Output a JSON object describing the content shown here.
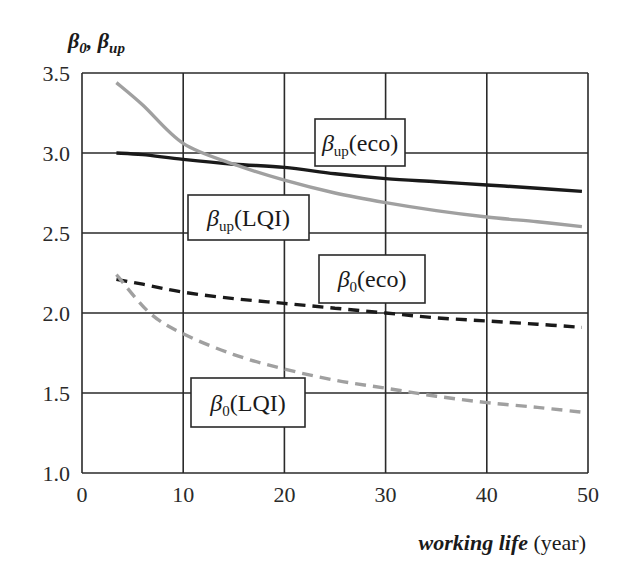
{
  "chart_data": {
    "type": "line",
    "title": "",
    "xlabel": "working life (year)",
    "xlabel_italic_part": "working life",
    "xlabel_unit": "(year)",
    "ylabel": "β0, βup",
    "xlim": [
      0,
      50
    ],
    "ylim": [
      1.0,
      3.5
    ],
    "x_ticks": [
      "0",
      "10",
      "20",
      "30",
      "40",
      "50"
    ],
    "y_ticks": [
      "1.0",
      "1.5",
      "2.0",
      "2.5",
      "3.0",
      "3.5"
    ],
    "grid": true,
    "legend": "inline labels in boxes",
    "series": [
      {
        "name": "βup(eco)",
        "label_main": "β",
        "label_sub": "up",
        "label_tail": "(eco)",
        "style": "solid",
        "color": "#1a1a1a",
        "x": [
          3.4,
          6,
          10,
          15,
          20,
          25,
          30,
          35,
          40,
          45,
          49.4
        ],
        "y": [
          3.0,
          2.99,
          2.96,
          2.93,
          2.91,
          2.87,
          2.84,
          2.82,
          2.8,
          2.78,
          2.76
        ]
      },
      {
        "name": "βup(LQI)",
        "label_main": "β",
        "label_sub": "up",
        "label_tail": "(LQI)",
        "style": "solid",
        "color": "#a0a0a0",
        "x": [
          3.4,
          6,
          10,
          15,
          20,
          25,
          30,
          35,
          40,
          45,
          49.4
        ],
        "y": [
          3.44,
          3.3,
          3.06,
          2.93,
          2.83,
          2.75,
          2.69,
          2.64,
          2.6,
          2.57,
          2.54
        ]
      },
      {
        "name": "β0(eco)",
        "label_main": "β",
        "label_sub": "0",
        "label_tail": "(eco)",
        "style": "dashed",
        "color": "#1a1a1a",
        "x": [
          3.4,
          6,
          10,
          15,
          20,
          25,
          30,
          35,
          40,
          45,
          49.4
        ],
        "y": [
          2.21,
          2.18,
          2.13,
          2.09,
          2.06,
          2.03,
          2.0,
          1.97,
          1.95,
          1.93,
          1.91
        ]
      },
      {
        "name": "β0(LQI)",
        "label_main": "β",
        "label_sub": "0",
        "label_tail": "(LQI)",
        "style": "dashed",
        "color": "#a0a0a0",
        "x": [
          3.4,
          6.7,
          10,
          15,
          20,
          25,
          30,
          35,
          40,
          45,
          49.4
        ],
        "y": [
          2.24,
          2.0,
          1.87,
          1.74,
          1.65,
          1.58,
          1.53,
          1.48,
          1.44,
          1.41,
          1.38
        ]
      }
    ],
    "label_boxes": [
      {
        "series": 0,
        "x": 315,
        "y": 119,
        "w": 90,
        "h": 47
      },
      {
        "series": 1,
        "x": 188,
        "y": 195,
        "w": 121,
        "h": 45
      },
      {
        "series": 2,
        "x": 319,
        "y": 255,
        "w": 106,
        "h": 48
      },
      {
        "series": 3,
        "x": 191,
        "y": 378,
        "w": 114,
        "h": 49
      }
    ]
  },
  "axis": {
    "ytitle_a": "β",
    "ytitle_a_sub": "0",
    "ytitle_sep": ", ",
    "ytitle_b": "β",
    "ytitle_b_sub": "up"
  }
}
